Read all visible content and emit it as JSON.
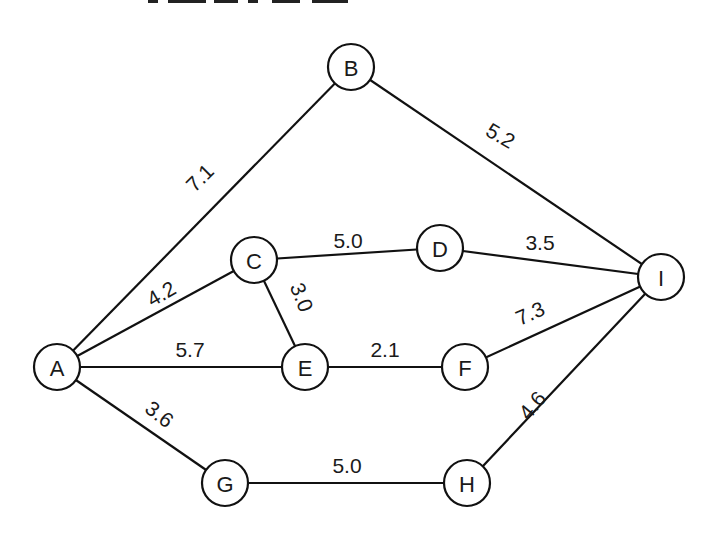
{
  "diagram": {
    "type": "weighted-undirected-graph",
    "colors": {
      "stroke": "#111111",
      "text": "#1a1a1a",
      "background": "#ffffff"
    },
    "node_radius": 23,
    "nodes": [
      {
        "id": "A",
        "label": "A",
        "x": 57,
        "y": 367
      },
      {
        "id": "B",
        "label": "B",
        "x": 351,
        "y": 67
      },
      {
        "id": "C",
        "label": "C",
        "x": 254,
        "y": 260
      },
      {
        "id": "D",
        "label": "D",
        "x": 440,
        "y": 248
      },
      {
        "id": "E",
        "label": "E",
        "x": 305,
        "y": 367
      },
      {
        "id": "F",
        "label": "F",
        "x": 465,
        "y": 367
      },
      {
        "id": "G",
        "label": "G",
        "x": 225,
        "y": 483
      },
      {
        "id": "H",
        "label": "H",
        "x": 467,
        "y": 483
      },
      {
        "id": "I",
        "label": "I",
        "x": 661,
        "y": 277
      }
    ],
    "edges": [
      {
        "from": "A",
        "to": "B",
        "weight": "7.1",
        "lx": 205,
        "ly": 183,
        "rot": -45
      },
      {
        "from": "B",
        "to": "I",
        "weight": "5.2",
        "lx": 497,
        "ly": 142,
        "rot": 30
      },
      {
        "from": "A",
        "to": "C",
        "weight": "4.2",
        "lx": 165,
        "ly": 300,
        "rot": -30
      },
      {
        "from": "C",
        "to": "D",
        "weight": "5.0",
        "lx": 348,
        "ly": 248,
        "rot": 0
      },
      {
        "from": "C",
        "to": "E",
        "weight": "3.0",
        "lx": 295,
        "ly": 300,
        "rot": 68
      },
      {
        "from": "D",
        "to": "I",
        "weight": "3.5",
        "lx": 540,
        "ly": 250,
        "rot": 0
      },
      {
        "from": "A",
        "to": "E",
        "weight": "5.7",
        "lx": 190,
        "ly": 357,
        "rot": 0
      },
      {
        "from": "E",
        "to": "F",
        "weight": "2.1",
        "lx": 385,
        "ly": 357,
        "rot": 0
      },
      {
        "from": "F",
        "to": "I",
        "weight": "7.3",
        "lx": 533,
        "ly": 320,
        "rot": -24
      },
      {
        "from": "A",
        "to": "G",
        "weight": "3.6",
        "lx": 155,
        "ly": 420,
        "rot": 38
      },
      {
        "from": "G",
        "to": "H",
        "weight": "5.0",
        "lx": 347,
        "ly": 473,
        "rot": 0
      },
      {
        "from": "H",
        "to": "I",
        "weight": "4.6",
        "lx": 538,
        "ly": 410,
        "rot": -50
      }
    ]
  }
}
